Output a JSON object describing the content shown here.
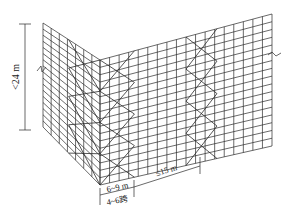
{
  "diagram": {
    "type": "scaffold-corner-isometric",
    "colors": {
      "line": "#2a2a2a",
      "background": "#ffffff"
    },
    "geometry": {
      "left_wall": {
        "top_outer": [
          43,
          23
        ],
        "top_corner": [
          100,
          60
        ],
        "bottom_outer": [
          43,
          127
        ],
        "bottom_corner": [
          100,
          185
        ],
        "columns": 7
      },
      "right_wall": {
        "top_corner": [
          100,
          60
        ],
        "top_outer": [
          272,
          14
        ],
        "bottom_corner": [
          100,
          185
        ],
        "bottom_outer": [
          272,
          146
        ],
        "columns": 18
      },
      "rows": 17
    },
    "labels": {
      "height": "<24 m",
      "brace_width": "6~9 m",
      "brace_spans": "4~6跨",
      "brace_spacing": "≤15 m"
    }
  }
}
